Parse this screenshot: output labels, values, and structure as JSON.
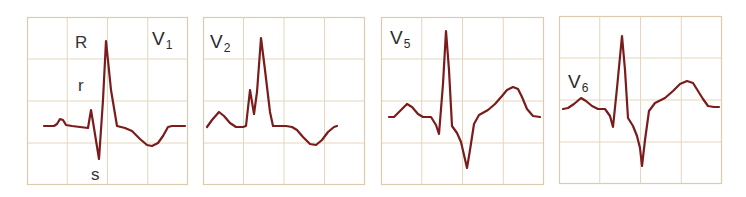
{
  "figure": {
    "title": "",
    "grid_color": "#e6d6bc",
    "border_color": "#dccbb0",
    "trace_color": "#7a1c1c",
    "background": "#ffffff"
  },
  "panels": [
    {
      "id": "v1",
      "lead_main": "V",
      "lead_sub": "1",
      "box": {
        "x": 27,
        "y": 17,
        "w": 161,
        "h": 168
      },
      "label_pos": {
        "x": 152,
        "y": 45
      },
      "annotations": [
        {
          "text": "R",
          "x": 75,
          "y": 48
        },
        {
          "text": "r",
          "x": 78,
          "y": 91
        },
        {
          "text": "s",
          "x": 91,
          "y": 180
        }
      ],
      "trace": [
        [
          44,
          126
        ],
        [
          54,
          126
        ],
        [
          57,
          124
        ],
        [
          60,
          119
        ],
        [
          63,
          120
        ],
        [
          66,
          125
        ],
        [
          72,
          126
        ],
        [
          80,
          127
        ],
        [
          88,
          128
        ],
        [
          91,
          110
        ],
        [
          94,
          128
        ],
        [
          99,
          159
        ],
        [
          103,
          100
        ],
        [
          106,
          41
        ],
        [
          111,
          90
        ],
        [
          117,
          126
        ],
        [
          125,
          128
        ],
        [
          132,
          131
        ],
        [
          140,
          139
        ],
        [
          147,
          145
        ],
        [
          152,
          146
        ],
        [
          158,
          143
        ],
        [
          163,
          136
        ],
        [
          168,
          127
        ],
        [
          172,
          126
        ],
        [
          185,
          126
        ]
      ]
    },
    {
      "id": "v2",
      "lead_main": "V",
      "lead_sub": "2",
      "box": {
        "x": 203,
        "y": 17,
        "w": 162,
        "h": 168
      },
      "label_pos": {
        "x": 210,
        "y": 48
      },
      "annotations": [],
      "trace": [
        [
          207,
          127
        ],
        [
          212,
          120
        ],
        [
          219,
          112
        ],
        [
          224,
          116
        ],
        [
          230,
          123
        ],
        [
          236,
          127
        ],
        [
          243,
          127
        ],
        [
          246,
          126
        ],
        [
          250,
          90
        ],
        [
          254,
          114
        ],
        [
          257,
          92
        ],
        [
          261,
          38
        ],
        [
          265,
          70
        ],
        [
          270,
          112
        ],
        [
          273,
          126
        ],
        [
          286,
          126
        ],
        [
          292,
          127
        ],
        [
          297,
          130
        ],
        [
          303,
          137
        ],
        [
          310,
          144
        ],
        [
          316,
          145
        ],
        [
          322,
          140
        ],
        [
          328,
          132
        ],
        [
          334,
          127
        ],
        [
          337,
          126
        ]
      ]
    },
    {
      "id": "v5",
      "lead_main": "V",
      "lead_sub": "5",
      "box": {
        "x": 381,
        "y": 17,
        "w": 163,
        "h": 168
      },
      "label_pos": {
        "x": 390,
        "y": 44
      },
      "annotations": [],
      "trace": [
        [
          389,
          117
        ],
        [
          394,
          117
        ],
        [
          400,
          111
        ],
        [
          407,
          104
        ],
        [
          412,
          107
        ],
        [
          418,
          114
        ],
        [
          423,
          117
        ],
        [
          431,
          117
        ],
        [
          436,
          125
        ],
        [
          439,
          134
        ],
        [
          443,
          84
        ],
        [
          446,
          31
        ],
        [
          449,
          70
        ],
        [
          452,
          126
        ],
        [
          457,
          133
        ],
        [
          461,
          142
        ],
        [
          464,
          155
        ],
        [
          467,
          168
        ],
        [
          470,
          150
        ],
        [
          474,
          124
        ],
        [
          479,
          115
        ],
        [
          488,
          110
        ],
        [
          495,
          104
        ],
        [
          502,
          96
        ],
        [
          507,
          90
        ],
        [
          513,
          87
        ],
        [
          518,
          89
        ],
        [
          522,
          97
        ],
        [
          527,
          109
        ],
        [
          533,
          116
        ],
        [
          540,
          117
        ]
      ]
    },
    {
      "id": "v6",
      "lead_main": "V",
      "lead_sub": "6",
      "box": {
        "x": 559,
        "y": 16,
        "w": 163,
        "h": 168
      },
      "label_pos": {
        "x": 568,
        "y": 88
      },
      "annotations": [],
      "trace": [
        [
          563,
          109
        ],
        [
          568,
          108
        ],
        [
          574,
          104
        ],
        [
          581,
          98
        ],
        [
          586,
          101
        ],
        [
          592,
          106
        ],
        [
          598,
          109
        ],
        [
          605,
          109
        ],
        [
          610,
          116
        ],
        [
          613,
          127
        ],
        [
          617,
          88
        ],
        [
          622,
          36
        ],
        [
          625,
          70
        ],
        [
          628,
          118
        ],
        [
          633,
          126
        ],
        [
          637,
          136
        ],
        [
          640,
          148
        ],
        [
          642,
          166
        ],
        [
          645,
          140
        ],
        [
          649,
          111
        ],
        [
          655,
          103
        ],
        [
          665,
          98
        ],
        [
          673,
          91
        ],
        [
          680,
          84
        ],
        [
          687,
          81
        ],
        [
          693,
          83
        ],
        [
          698,
          91
        ],
        [
          703,
          99
        ],
        [
          708,
          106
        ],
        [
          714,
          107
        ],
        [
          719,
          107
        ]
      ]
    }
  ]
}
